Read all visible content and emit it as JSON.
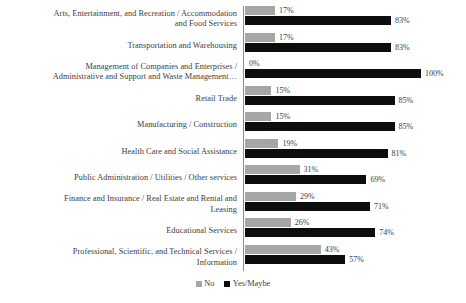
{
  "chart_data": {
    "type": "bar",
    "orientation": "horizontal",
    "grouped": true,
    "title": "",
    "xlabel": "",
    "ylabel": "",
    "xlim": [
      0,
      100
    ],
    "grid": false,
    "value_suffix": "%",
    "legend_position": "bottom-center",
    "colors": {
      "no": "#a6a6a6",
      "yes": "#0d0d0d",
      "text": "#3d3d3d",
      "axis": "#8d8d8d",
      "background": "#ffffff"
    },
    "categories": [
      "Arts, Entertainment, and Recreation / Accommodation and Food Services",
      "Transportation and Warehousing",
      "Management of Companies and Enterprises / Administrative and Support and Waste Management…",
      "Retail Trade",
      "Manufacturing / Construction",
      "Health Care and Social Assistance",
      "Public Administration / Utilities / Other services",
      "Finance and Insurance / Real Estate and Rental and Leasing",
      "Educational Services",
      "Professional, Scientific, and Technical Services / Information"
    ],
    "series": [
      {
        "name": "No",
        "color": "#a6a6a6",
        "values": [
          17,
          17,
          0,
          15,
          15,
          19,
          31,
          29,
          26,
          43
        ],
        "labels": [
          "17%",
          "17%",
          "0%",
          "15%",
          "15%",
          "19%",
          "31%",
          "29%",
          "26%",
          "43%"
        ]
      },
      {
        "name": "Yes/Maybe",
        "color": "#0d0d0d",
        "values": [
          83,
          83,
          100,
          85,
          85,
          81,
          69,
          71,
          74,
          57
        ],
        "labels": [
          "83%",
          "83%",
          "100%",
          "85%",
          "85%",
          "81%",
          "69%",
          "71%",
          "74%",
          "57%"
        ]
      }
    ],
    "rows": [
      {
        "label": "Arts, Entertainment, and Recreation / Accommodation and Food Services",
        "label_lines": [
          "Arts, Entertainment, and Recreation / Accommodation",
          "and Food Services"
        ],
        "no_value": 17,
        "no_label": "17%",
        "yes_value": 83,
        "yes_label": "83%"
      },
      {
        "label": "Transportation and Warehousing",
        "label_lines": [
          "Transportation and Warehousing"
        ],
        "no_value": 17,
        "no_label": "17%",
        "yes_value": 83,
        "yes_label": "83%"
      },
      {
        "label": "Management of Companies and Enterprises / Administrative and Support and Waste Management…",
        "label_lines": [
          "Management of Companies and Enterprises /",
          "Administrative and Support and Waste Management…"
        ],
        "no_value": 0,
        "no_label": "0%",
        "yes_value": 100,
        "yes_label": "100%"
      },
      {
        "label": "Retail Trade",
        "label_lines": [
          "Retail Trade"
        ],
        "no_value": 15,
        "no_label": "15%",
        "yes_value": 85,
        "yes_label": "85%"
      },
      {
        "label": "Manufacturing / Construction",
        "label_lines": [
          "Manufacturing / Construction"
        ],
        "no_value": 15,
        "no_label": "15%",
        "yes_value": 85,
        "yes_label": "85%"
      },
      {
        "label": "Health Care and Social Assistance",
        "label_lines": [
          "Health Care and Social Assistance"
        ],
        "no_value": 19,
        "no_label": "19%",
        "yes_value": 81,
        "yes_label": "81%"
      },
      {
        "label": "Public Administration / Utilities / Other services",
        "label_lines": [
          "Public Administration / Utilities / Other services"
        ],
        "no_value": 31,
        "no_label": "31%",
        "yes_value": 69,
        "yes_label": "69%"
      },
      {
        "label": "Finance and Insurance / Real Estate and Rental and Leasing",
        "label_lines": [
          "Finance and Insurance / Real Estate and Rental and",
          "Leasing"
        ],
        "no_value": 29,
        "no_label": "29%",
        "yes_value": 71,
        "yes_label": "71%"
      },
      {
        "label": "Educational Services",
        "label_lines": [
          "Educational Services"
        ],
        "no_value": 26,
        "no_label": "26%",
        "yes_value": 74,
        "yes_label": "74%"
      },
      {
        "label": "Professional, Scientific, and Technical Services / Information",
        "label_lines": [
          "Professional, Scientific, and Technical Services /",
          "Information"
        ],
        "no_value": 43,
        "no_label": "43%",
        "yes_value": 57,
        "yes_label": "57%"
      }
    ],
    "legend": [
      {
        "label": "No",
        "color": "#a6a6a6"
      },
      {
        "label": "Yes/Maybe",
        "color": "#0d0d0d"
      }
    ]
  }
}
